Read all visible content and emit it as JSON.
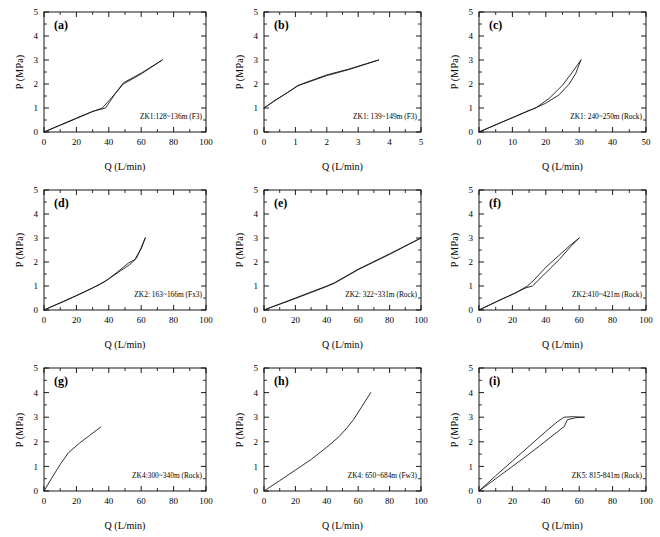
{
  "figure": {
    "axis_labels": {
      "x": "Q (L/min)",
      "y": "P (MPa)"
    },
    "tick_color": "#000000",
    "curve_color": "#1a1a1a"
  },
  "chart_data": [
    {
      "type": "line",
      "panel": "(a)",
      "title": "ZK1:128~136m (F3)",
      "xlabel": "Q (L/min)",
      "ylabel": "P (MPa)",
      "xlim": [
        0,
        100
      ],
      "ylim": [
        0,
        5
      ],
      "xticks": [
        0,
        20,
        40,
        60,
        80,
        100
      ],
      "yticks": [
        0,
        1,
        2,
        3,
        4,
        5
      ],
      "grid": false,
      "legend": "none",
      "series": [
        {
          "name": "loading",
          "x": [
            0,
            10,
            20,
            30,
            36,
            42,
            49,
            60,
            73
          ],
          "y": [
            0.0,
            0.28,
            0.56,
            0.85,
            1.0,
            1.45,
            2.0,
            2.42,
            3.0
          ]
        },
        {
          "name": "unloading",
          "x": [
            73,
            60,
            49,
            44,
            38,
            30,
            20,
            10,
            0
          ],
          "y": [
            3.0,
            2.45,
            2.05,
            1.6,
            1.0,
            0.86,
            0.58,
            0.29,
            0.0
          ]
        }
      ]
    },
    {
      "type": "line",
      "panel": "(b)",
      "title": "ZK1: 139~149m (F3)",
      "xlabel": "Q (L/min)",
      "ylabel": "P (MPa)",
      "xlim": [
        0,
        5
      ],
      "ylim": [
        0,
        5
      ],
      "xticks": [
        0,
        1,
        2,
        3,
        4,
        5
      ],
      "yticks": [
        0,
        1,
        2,
        3,
        4,
        5
      ],
      "grid": false,
      "legend": "none",
      "series": [
        {
          "name": "loading",
          "x": [
            0.0,
            0.4,
            0.75,
            1.1,
            1.35,
            2.0,
            2.7,
            3.65
          ],
          "y": [
            1.0,
            1.35,
            1.65,
            1.95,
            2.05,
            2.35,
            2.6,
            3.0
          ]
        },
        {
          "name": "unloading",
          "x": [
            3.65,
            2.7,
            2.0,
            1.3,
            1.05,
            0.7,
            0.35,
            0.0
          ],
          "y": [
            3.0,
            2.62,
            2.38,
            2.05,
            1.9,
            1.6,
            1.32,
            1.0
          ]
        }
      ]
    },
    {
      "type": "line",
      "panel": "(c)",
      "title": "ZK1: 240~250m (Rock)",
      "xlabel": "Q (L/min)",
      "ylabel": "P (MPa)",
      "xlim": [
        0,
        50
      ],
      "ylim": [
        0,
        5
      ],
      "xticks": [
        0,
        10,
        20,
        30,
        40,
        50
      ],
      "yticks": [
        0,
        1,
        2,
        3,
        4,
        5
      ],
      "grid": false,
      "legend": "none",
      "series": [
        {
          "name": "loading",
          "x": [
            0,
            5,
            10,
            15,
            17,
            21,
            25,
            28,
            30.5
          ],
          "y": [
            0.0,
            0.3,
            0.6,
            0.9,
            1.0,
            1.4,
            1.95,
            2.5,
            3.0
          ]
        },
        {
          "name": "unloading",
          "x": [
            30.5,
            29,
            27,
            24,
            20,
            16,
            11,
            6,
            0
          ],
          "y": [
            3.0,
            2.45,
            2.0,
            1.55,
            1.2,
            0.95,
            0.65,
            0.36,
            0.0
          ]
        }
      ]
    },
    {
      "type": "line",
      "panel": "(d)",
      "title": "ZK2: 163~166m (Fx3)",
      "xlabel": "Q (L/min)",
      "ylabel": "P (MPa)",
      "xlim": [
        0,
        100
      ],
      "ylim": [
        0,
        5
      ],
      "xticks": [
        0,
        20,
        40,
        60,
        80,
        100
      ],
      "yticks": [
        0,
        1,
        2,
        3,
        4,
        5
      ],
      "grid": false,
      "legend": "none",
      "series": [
        {
          "name": "loading",
          "x": [
            0,
            12,
            24,
            34,
            40,
            47,
            53,
            57,
            60,
            62.5
          ],
          "y": [
            0.0,
            0.35,
            0.72,
            1.05,
            1.3,
            1.62,
            1.9,
            2.15,
            2.6,
            3.0
          ]
        },
        {
          "name": "unloading",
          "x": [
            62.5,
            60,
            56,
            52,
            46,
            38,
            30,
            20,
            10,
            0
          ],
          "y": [
            3.0,
            2.55,
            2.1,
            1.95,
            1.62,
            1.2,
            0.92,
            0.6,
            0.3,
            0.0
          ]
        }
      ]
    },
    {
      "type": "line",
      "panel": "(e)",
      "title": "ZK2: 322~331m (Rock)",
      "xlabel": "Q (L/min)",
      "ylabel": "P (MPa)",
      "xlim": [
        0,
        100
      ],
      "ylim": [
        0,
        5
      ],
      "xticks": [
        0,
        20,
        40,
        60,
        80,
        100
      ],
      "yticks": [
        0,
        1,
        2,
        3,
        4,
        5
      ],
      "grid": false,
      "legend": "none",
      "series": [
        {
          "name": "loading",
          "x": [
            0,
            20,
            40,
            45,
            60,
            80,
            100
          ],
          "y": [
            0.0,
            0.48,
            0.98,
            1.12,
            1.68,
            2.32,
            3.0
          ]
        },
        {
          "name": "unloading",
          "x": [
            100,
            80,
            60,
            45,
            40,
            20,
            0
          ],
          "y": [
            3.0,
            2.34,
            1.7,
            1.14,
            1.0,
            0.5,
            0.0
          ]
        }
      ]
    },
    {
      "type": "line",
      "panel": "(f)",
      "title": "ZK2:410~421m (Rock)",
      "xlabel": "Q (L/min)",
      "ylabel": "P (MPa)",
      "xlim": [
        0,
        100
      ],
      "ylim": [
        0,
        5
      ],
      "xticks": [
        0,
        20,
        40,
        60,
        80,
        100
      ],
      "yticks": [
        0,
        1,
        2,
        3,
        4,
        5
      ],
      "grid": false,
      "legend": "none",
      "series": [
        {
          "name": "loading",
          "x": [
            0,
            10,
            20,
            28,
            32,
            40,
            48,
            55,
            60
          ],
          "y": [
            0.0,
            0.33,
            0.65,
            0.92,
            1.0,
            1.55,
            2.1,
            2.65,
            3.0
          ]
        },
        {
          "name": "unloading",
          "x": [
            60,
            55,
            48,
            40,
            33,
            29,
            22,
            12,
            0
          ],
          "y": [
            3.0,
            2.72,
            2.28,
            1.78,
            1.25,
            1.0,
            0.72,
            0.4,
            0.0
          ]
        }
      ]
    },
    {
      "type": "line",
      "panel": "(g)",
      "title": "ZK4:300~340m (Rock)",
      "xlabel": "Q (L/min)",
      "ylabel": "P (MPa)",
      "xlim": [
        0,
        100
      ],
      "ylim": [
        0,
        5
      ],
      "xticks": [
        0,
        20,
        40,
        60,
        80,
        100
      ],
      "yticks": [
        0,
        1,
        2,
        3,
        4,
        5
      ],
      "grid": false,
      "legend": "none",
      "series": [
        {
          "name": "loading",
          "x": [
            0,
            5,
            10,
            15,
            22,
            28,
            35
          ],
          "y": [
            0.0,
            0.55,
            1.08,
            1.55,
            1.95,
            2.25,
            2.6
          ]
        }
      ]
    },
    {
      "type": "line",
      "panel": "(h)",
      "title": "ZK4: 650~684m (Fw3)",
      "xlabel": "Q (L/min)",
      "ylabel": "P (MPa)",
      "xlim": [
        0,
        100
      ],
      "ylim": [
        0,
        5
      ],
      "xticks": [
        0,
        20,
        40,
        60,
        80,
        100
      ],
      "yticks": [
        0,
        1,
        2,
        3,
        4,
        5
      ],
      "grid": false,
      "legend": "none",
      "series": [
        {
          "name": "loading",
          "x": [
            0,
            10,
            20,
            30,
            40,
            48,
            53,
            57,
            62,
            68
          ],
          "y": [
            0.0,
            0.42,
            0.85,
            1.28,
            1.78,
            2.22,
            2.58,
            2.9,
            3.4,
            4.0
          ]
        }
      ]
    },
    {
      "type": "line",
      "panel": "(i)",
      "title": "ZK5: 815-841m (Rock)",
      "xlabel": "Q (L/min)",
      "ylabel": "P (MPa)",
      "xlim": [
        0,
        100
      ],
      "ylim": [
        0,
        5
      ],
      "xticks": [
        0,
        20,
        40,
        60,
        80,
        100
      ],
      "yticks": [
        0,
        1,
        2,
        3,
        4,
        5
      ],
      "grid": false,
      "legend": "none",
      "series": [
        {
          "name": "loading",
          "x": [
            0,
            10,
            20,
            30,
            40,
            47,
            51,
            56,
            63
          ],
          "y": [
            0.0,
            0.62,
            1.22,
            1.82,
            2.42,
            2.82,
            3.0,
            3.02,
            3.0
          ]
        },
        {
          "name": "unloading",
          "x": [
            63,
            58,
            53,
            51,
            45,
            36,
            26,
            15,
            5,
            0
          ],
          "y": [
            3.0,
            2.98,
            2.9,
            2.62,
            2.3,
            1.82,
            1.3,
            0.75,
            0.25,
            0.0
          ]
        }
      ]
    }
  ]
}
